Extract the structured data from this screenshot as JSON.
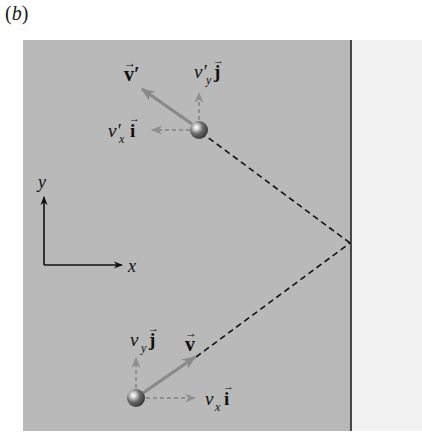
{
  "figure": {
    "panel_label_open": "(",
    "panel_label_letter": "b",
    "panel_label_close": ")"
  },
  "colors": {
    "field": "#b9b9b9",
    "wall": "#f2f2f2",
    "wall_line": "#222222",
    "path": "#111111",
    "velocity_arrow": "#8a8a8a",
    "component_arrow": "#8f8f8f",
    "axis": "#111111",
    "ball_dark": "#3a3a3a",
    "ball_light": "#ffffff"
  },
  "axes": {
    "x_label": "x",
    "y_label": "y"
  },
  "before_bounce": {
    "velocity_label": "v",
    "vx_label": "v",
    "vx_sub": "x",
    "vx_unit": "i",
    "vy_label": "v",
    "vy_sub": "y",
    "vy_unit": "j"
  },
  "after_bounce": {
    "velocity_label": "v′",
    "vx_label": "v′",
    "vx_sub": "x",
    "vx_unit": "i",
    "vy_label": "v′",
    "vy_sub": "y",
    "vy_unit": "j"
  },
  "vector_marker": "→"
}
